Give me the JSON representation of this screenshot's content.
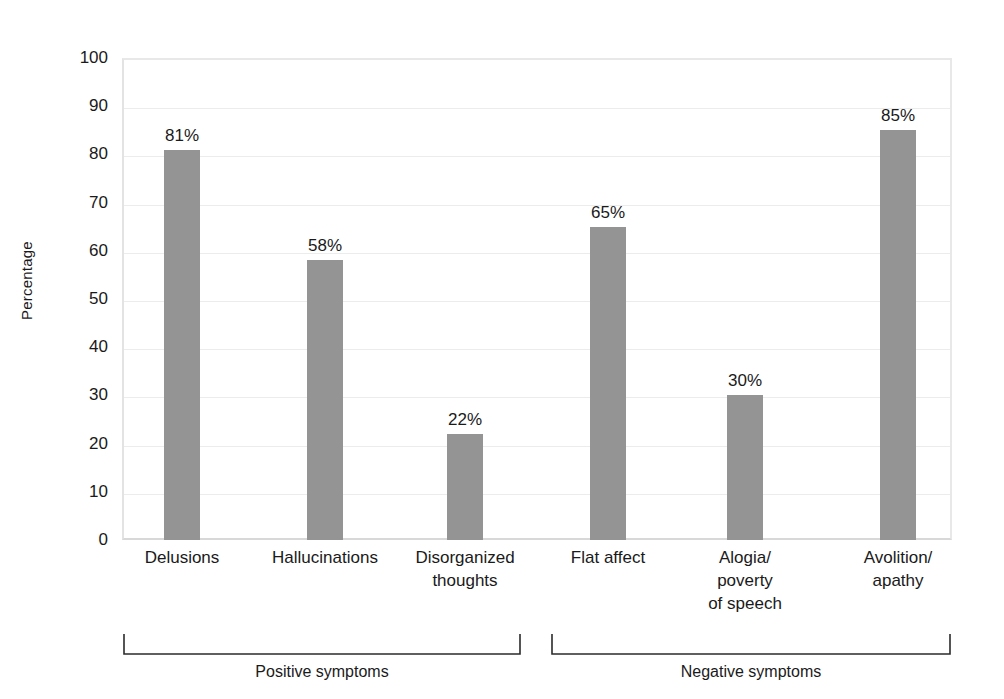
{
  "chart_data": {
    "type": "bar",
    "title": "",
    "xlabel": "",
    "ylabel": "Percentage",
    "ylim": [
      0,
      100
    ],
    "ytick_step": 10,
    "grid": true,
    "legend": "none",
    "categories": [
      "Delusions",
      "Hallucinations",
      "Disorganized thoughts",
      "Flat affect",
      "Alogia/ poverty of speech",
      "Avolition/ apathy"
    ],
    "values": [
      81,
      58,
      22,
      65,
      30,
      85
    ],
    "value_labels": [
      "81%",
      "58%",
      "22%",
      "65%",
      "30%",
      "85%"
    ],
    "y_tick_labels": [
      "100",
      "90",
      "80",
      "70",
      "60",
      "50",
      "40",
      "30",
      "20",
      "10",
      "0"
    ],
    "groups": [
      {
        "label": "Positive symptoms",
        "categories": [
          "Delusions",
          "Hallucinations",
          "Disorganized thoughts"
        ]
      },
      {
        "label": "Negative symptoms",
        "categories": [
          "Flat affect",
          "Alogia/ poverty of speech",
          "Avolition/ apathy"
        ]
      }
    ],
    "bar_color": "#949494",
    "grid_color": "#ececec",
    "text_color": "#1a1a1a"
  },
  "axis": {
    "y_title": "Percentage"
  },
  "x_category_lines": [
    [
      "Delusions"
    ],
    [
      "Hallucinations"
    ],
    [
      "Disorganized",
      "thoughts"
    ],
    [
      "Flat affect"
    ],
    [
      "Alogia/",
      "poverty",
      "of speech"
    ],
    [
      "Avolition/",
      "apathy"
    ]
  ],
  "group_labels": {
    "positive": "Positive symptoms",
    "negative": "Negative symptoms"
  },
  "y_ticks": [
    {
      "value": "100"
    },
    {
      "value": "90"
    },
    {
      "value": "80"
    },
    {
      "value": "70"
    },
    {
      "value": "60"
    },
    {
      "value": "50"
    },
    {
      "value": "40"
    },
    {
      "value": "30"
    },
    {
      "value": "20"
    },
    {
      "value": "10"
    },
    {
      "value": "0"
    }
  ]
}
